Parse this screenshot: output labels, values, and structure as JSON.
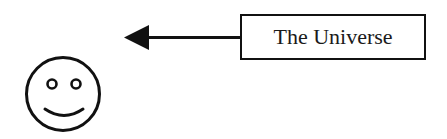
{
  "diagram": {
    "box": {
      "label": "The Universe"
    },
    "arrow": {
      "direction": "left",
      "from": "box",
      "to": "smiley-face"
    },
    "face": {
      "type": "smiley",
      "expression": "smile"
    },
    "colors": {
      "stroke": "#111111",
      "background": "#ffffff"
    }
  }
}
